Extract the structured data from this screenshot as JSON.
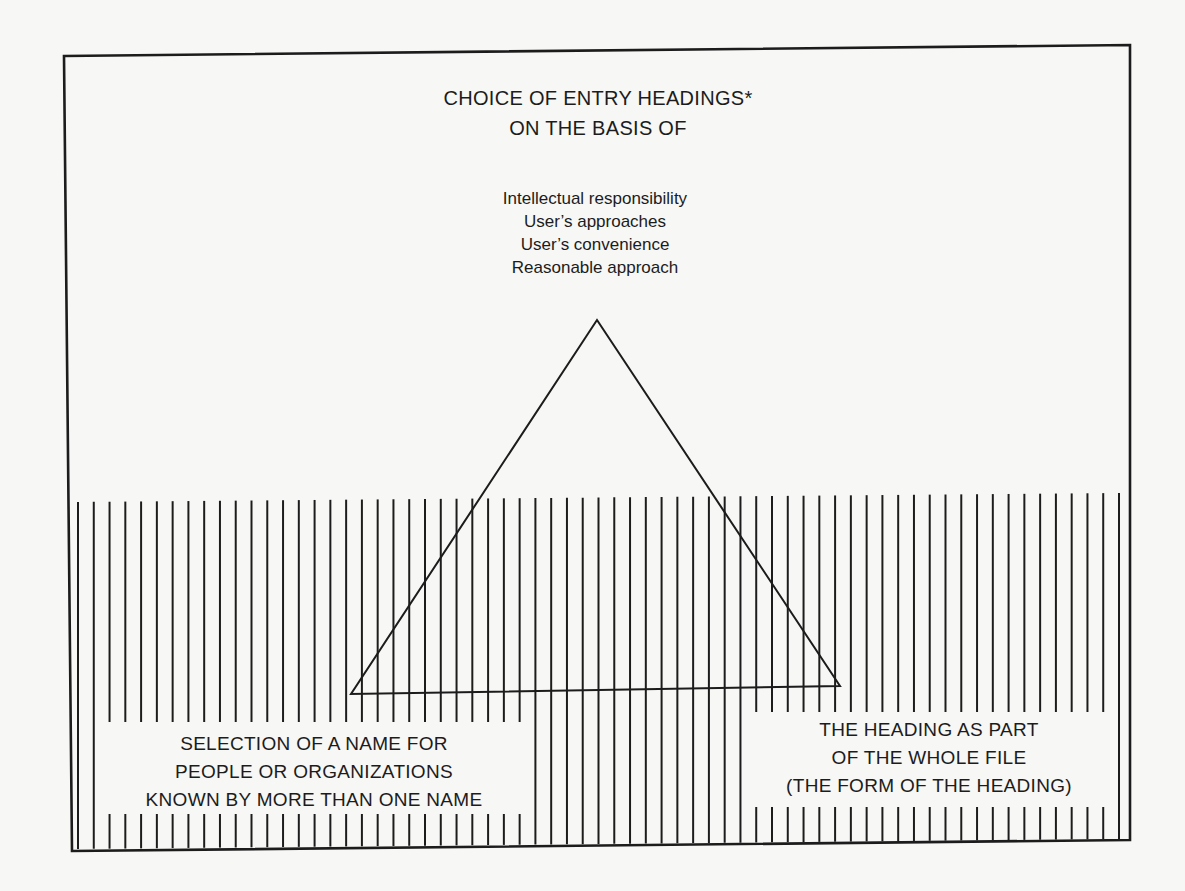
{
  "diagram": {
    "title_lines": [
      "CHOICE OF ENTRY HEADINGS*",
      "ON THE BASIS OF"
    ],
    "bases": [
      "Intellectual responsibility",
      "User’s approaches",
      "User’s convenience",
      "Reasonable approach"
    ],
    "left_box_lines": [
      "SELECTION OF A NAME FOR",
      "PEOPLE OR ORGANIZATIONS",
      "KNOWN BY MORE THAN ONE NAME"
    ],
    "right_box_lines": [
      "THE HEADING  AS PART",
      "OF THE WHOLE FILE",
      "(THE FORM OF THE HEADING)"
    ],
    "shapes": {
      "frame": {
        "tl": [
          64,
          56
        ],
        "tr": [
          1130,
          45
        ],
        "br": [
          1130,
          840
        ],
        "bl": [
          72,
          851
        ]
      },
      "triangle": {
        "apex": [
          597,
          320
        ],
        "left": [
          351,
          694
        ],
        "right": [
          840,
          686
        ]
      },
      "hatch": {
        "x_start": 78,
        "x_end": 1119,
        "count": 67,
        "top_left_y": 502,
        "top_right_y": 493,
        "bottom_left_y": 849,
        "bottom_right_y": 839
      },
      "left_box": {
        "x": 96,
        "y": 722,
        "w": 436,
        "h": 92
      },
      "right_box": {
        "x": 752,
        "y": 712,
        "w": 354,
        "h": 95
      }
    },
    "colors": {
      "ink": "#1c1c1c",
      "paper": "#f7f7f5"
    }
  }
}
